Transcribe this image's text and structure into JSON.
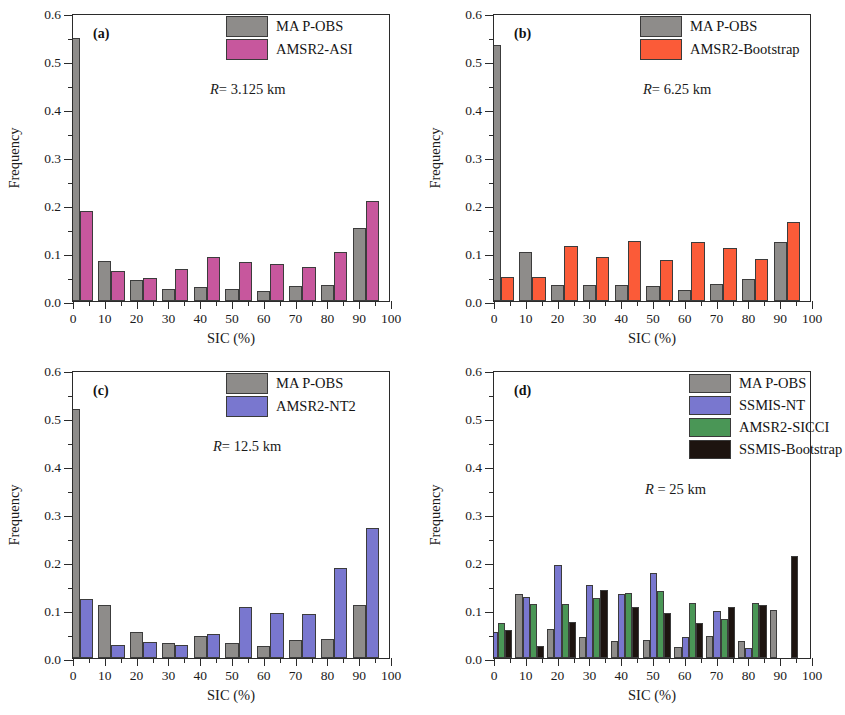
{
  "figure": {
    "axis_x_title": "SIC (%)",
    "axis_y_title": "Frequency",
    "y_ticks": [
      "0.0",
      "0.1",
      "0.2",
      "0.3",
      "0.4",
      "0.5",
      "0.6"
    ],
    "x_ticks": [
      "0",
      "10",
      "20",
      "30",
      "40",
      "50",
      "60",
      "70",
      "80",
      "90",
      "100"
    ]
  },
  "colors": {
    "ma_p_obs": "#8e8c8a",
    "amsr2_asi": "#c7579d",
    "amsr2_bootstrap": "#fb5b38",
    "amsr2_nt2": "#7977cf",
    "ssmis_nt": "#7977cf",
    "amsr2_sicci": "#4a9656",
    "ssmis_bootstrap": "#1d1410",
    "axis": "#2b2b2b"
  },
  "chart_data": [
    {
      "type": "bar",
      "panel": "a",
      "panel_label": "(a)",
      "title": "",
      "annotation": "R= 3.125 km",
      "annotation_symbol": "R",
      "annotation_rest": "= 3.125 km",
      "xlabel": "SIC (%)",
      "ylabel": "Frequency",
      "xlim": [
        0,
        100
      ],
      "ylim": [
        0,
        0.6
      ],
      "grid": false,
      "legend_position": "top-right",
      "categories": [
        "0-10",
        "10-20",
        "20-30",
        "30-40",
        "40-50",
        "50-60",
        "60-70",
        "70-80",
        "80-90",
        "90-100"
      ],
      "series": [
        {
          "name": "MA P-OBS",
          "color": "#8e8c8a",
          "values": [
            0.547,
            0.083,
            0.043,
            0.026,
            0.029,
            0.026,
            0.021,
            0.031,
            0.034,
            0.153
          ]
        },
        {
          "name": "AMSR2-ASI",
          "color": "#c7579d",
          "values": [
            0.188,
            0.062,
            0.048,
            0.066,
            0.091,
            0.082,
            0.077,
            0.071,
            0.103,
            0.208
          ]
        }
      ]
    },
    {
      "type": "bar",
      "panel": "b",
      "panel_label": "(b)",
      "title": "",
      "annotation": "R= 6.25 km",
      "annotation_symbol": "R",
      "annotation_rest": "= 6.25 km",
      "xlabel": "SIC (%)",
      "ylabel": "Frequency",
      "xlim": [
        0,
        100
      ],
      "ylim": [
        0,
        0.6
      ],
      "grid": false,
      "legend_position": "top-right",
      "categories": [
        "0-10",
        "10-20",
        "20-30",
        "30-40",
        "40-50",
        "50-60",
        "60-70",
        "70-80",
        "80-90",
        "90-100"
      ],
      "series": [
        {
          "name": "MA P-OBS",
          "color": "#8e8c8a",
          "values": [
            0.534,
            0.102,
            0.034,
            0.034,
            0.034,
            0.032,
            0.023,
            0.035,
            0.045,
            0.122
          ]
        },
        {
          "name": "AMSR2-Bootstrap",
          "color": "#fb5b38",
          "values": [
            0.049,
            0.049,
            0.114,
            0.092,
            0.126,
            0.086,
            0.122,
            0.11,
            0.088,
            0.165
          ]
        }
      ]
    },
    {
      "type": "bar",
      "panel": "c",
      "panel_label": "(c)",
      "title": "",
      "annotation": "R= 12.5 km",
      "annotation_symbol": "R",
      "annotation_rest": "= 12.5 km",
      "xlabel": "SIC (%)",
      "ylabel": "Frequency",
      "xlim": [
        0,
        100
      ],
      "ylim": [
        0,
        0.6
      ],
      "grid": false,
      "legend_position": "top-right",
      "categories": [
        "0-10",
        "10-20",
        "20-30",
        "30-40",
        "40-50",
        "50-60",
        "60-70",
        "70-80",
        "80-90",
        "90-100"
      ],
      "series": [
        {
          "name": "MA P-OBS",
          "color": "#8e8c8a",
          "values": [
            0.519,
            0.11,
            0.055,
            0.031,
            0.046,
            0.032,
            0.026,
            0.037,
            0.039,
            0.111
          ]
        },
        {
          "name": "AMSR2-NT2",
          "color": "#7977cf",
          "values": [
            0.123,
            0.027,
            0.033,
            0.027,
            0.051,
            0.107,
            0.093,
            0.091,
            0.187,
            0.271
          ]
        }
      ]
    },
    {
      "type": "bar",
      "panel": "d",
      "panel_label": "(d)",
      "title": "",
      "annotation": "R = 25 km",
      "annotation_symbol": "R",
      "annotation_rest": " = 25 km",
      "xlabel": "SIC (%)",
      "ylabel": "Frequency",
      "xlim": [
        0,
        100
      ],
      "ylim": [
        0,
        0.6
      ],
      "grid": false,
      "legend_position": "top-right",
      "categories": [
        "0-10",
        "10-20",
        "20-30",
        "30-40",
        "40-50",
        "50-60",
        "60-70",
        "70-80",
        "80-90",
        "90-100"
      ],
      "series": [
        {
          "name": "MA P-OBS",
          "color": "#8e8c8a",
          "values": [
            0.485,
            0.133,
            0.061,
            0.043,
            0.036,
            0.037,
            0.022,
            0.045,
            0.035,
            0.1
          ]
        },
        {
          "name": "SSMIS-NT",
          "color": "#7977cf",
          "values": [
            0.054,
            0.127,
            0.194,
            0.152,
            0.133,
            0.177,
            0.043,
            0.098,
            0.021,
            0.0
          ]
        },
        {
          "name": "AMSR2-SICCI",
          "color": "#4a9656",
          "values": [
            0.073,
            0.112,
            0.112,
            0.125,
            0.136,
            0.139,
            0.114,
            0.081,
            0.114,
            0.0
          ]
        },
        {
          "name": "SSMIS-Bootstrap",
          "color": "#1d1410",
          "values": [
            0.059,
            0.025,
            0.075,
            0.142,
            0.107,
            0.094,
            0.072,
            0.107,
            0.11,
            0.213
          ]
        }
      ]
    }
  ]
}
